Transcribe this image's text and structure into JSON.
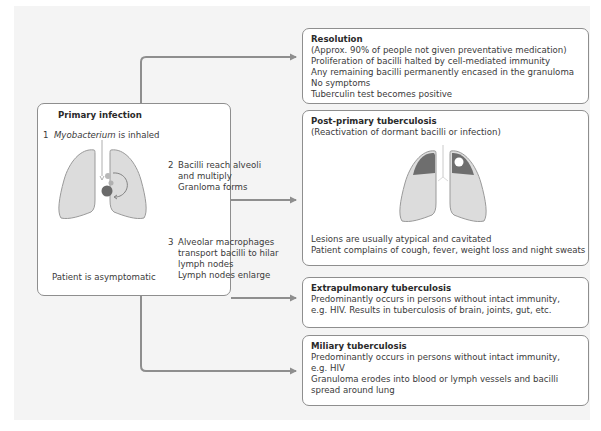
{
  "diagram": {
    "colors": {
      "panel_background": "#f4f4f4",
      "box_border": "#8e8e8e",
      "connector": "#8e8e8e",
      "lung_fill": "#dcdcdc",
      "lung_outline": "#9a9a9a",
      "lesion_fill": "#6e6e6e",
      "granuloma_fill": "#6a6a6a"
    },
    "primary": {
      "title": "Primary infection",
      "step1": {
        "number": "1",
        "text_italic": "Myobacterium",
        "text": " is inhaled"
      },
      "step2": {
        "number": "2",
        "lines": [
          "Bacilli reach alveoli",
          "and multiply",
          "Granloma forms"
        ]
      },
      "step3": {
        "number": "3",
        "lines": [
          "Alveolar macrophages",
          "transport bacilli to hilar",
          "lymph nodes",
          "Lymph nodes enlarge"
        ]
      },
      "footer": "Patient is asymptomatic",
      "illustration": "lungs-with-granuloma"
    },
    "outcomes": [
      {
        "id": "resolution",
        "title": "Resolution",
        "lines": [
          "(Approx. 90% of people not given preventative medication)",
          "Proliferation of bacilli halted by cell-mediated immunity",
          "Any remaining bacilli permanently encased in the granuloma",
          "No symptoms",
          "Tuberculin test becomes positive"
        ]
      },
      {
        "id": "post-primary",
        "title": "Post-primary tuberculosis",
        "subtitle": "(Reactivation of dormant bacilli or infection)",
        "illustration": "lungs-with-apical-cavitated-lesions",
        "lines": [
          "Lesions are usually atypical and cavitated",
          "Patient complains of cough, fever, weight loss and night sweats"
        ]
      },
      {
        "id": "extrapulmonary",
        "title": "Extrapulmonary tuberculosis",
        "lines": [
          "Predominantly occurs in persons without intact immunity,",
          "e.g. HIV. Results in tuberculosis of brain, joints, gut, etc."
        ]
      },
      {
        "id": "miliary",
        "title": "Miliary tuberculosis",
        "lines": [
          "Predominantly occurs in persons without intact immunity,",
          "e.g. HIV",
          "Granuloma erodes into blood or lymph vessels and bacilli",
          "spread around lung"
        ]
      }
    ],
    "arrows": [
      {
        "from": "primary",
        "to": "resolution"
      },
      {
        "from": "primary",
        "to": "post-primary"
      },
      {
        "from": "primary",
        "to": "extrapulmonary"
      },
      {
        "from": "primary",
        "to": "miliary"
      }
    ]
  }
}
